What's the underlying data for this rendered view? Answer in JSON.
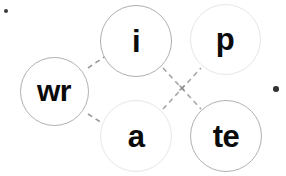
{
  "canvas": {
    "width": 286,
    "height": 176,
    "background": "#ffffff"
  },
  "exercise": {
    "type": "word-building-tiles",
    "assembled_words": [
      "write",
      "wrap"
    ],
    "tiles": [
      {
        "id": "wr",
        "label": "wr",
        "role": "onset",
        "cx": 54,
        "cy": 91,
        "d": 69,
        "stroke": "#b0b0b0",
        "stroke_width": 1.6,
        "font_size": 30,
        "state": "active"
      },
      {
        "id": "i",
        "label": "i",
        "role": "vowel",
        "cx": 136,
        "cy": 41,
        "d": 72,
        "stroke": "#b0b0b0",
        "stroke_width": 1.6,
        "font_size": 31,
        "state": "active"
      },
      {
        "id": "p",
        "label": "p",
        "role": "ending",
        "cx": 225,
        "cy": 39,
        "d": 71,
        "stroke": "#e6e6e6",
        "stroke_width": 1.6,
        "font_size": 31,
        "state": "dim"
      },
      {
        "id": "a",
        "label": "a",
        "role": "vowel",
        "cx": 136,
        "cy": 136,
        "d": 72,
        "stroke": "#e6e6e6",
        "stroke_width": 1.6,
        "font_size": 31,
        "state": "dim"
      },
      {
        "id": "te",
        "label": "te",
        "role": "ending",
        "cx": 226,
        "cy": 136,
        "d": 72,
        "stroke": "#b0b0b0",
        "stroke_width": 1.6,
        "font_size": 31,
        "state": "active"
      }
    ],
    "connectors": [
      {
        "id": "wr-i",
        "from": "wr",
        "to": "i",
        "x1": 88,
        "y1": 68,
        "x2": 110,
        "y2": 53,
        "stroke": "#9a9a9a"
      },
      {
        "id": "wr-a",
        "from": "wr",
        "to": "a",
        "x1": 88,
        "y1": 114,
        "x2": 110,
        "y2": 128,
        "stroke": "#9a9a9a"
      },
      {
        "id": "i-te",
        "from": "i",
        "to": "te",
        "x1": 163,
        "y1": 68,
        "x2": 201,
        "y2": 109,
        "stroke": "#a8a8a8"
      },
      {
        "id": "a-p",
        "from": "a",
        "to": "p",
        "x1": 163,
        "y1": 109,
        "x2": 201,
        "y2": 68,
        "stroke": "#a8a8a8"
      }
    ],
    "crossing_marker": {
      "id": "connector-crossing",
      "cx": 182,
      "cy": 88,
      "size": 4,
      "color": "#8f8f8f"
    },
    "dash_pattern": "5 4",
    "dash_width": 1.6
  },
  "markers": [
    {
      "id": "top-left-dot",
      "cx": 6,
      "cy": 11,
      "r": 2.4,
      "color": "#3a3a3a"
    },
    {
      "id": "right-dot",
      "cx": 276,
      "cy": 89,
      "r": 2.8,
      "color": "#333333"
    }
  ]
}
